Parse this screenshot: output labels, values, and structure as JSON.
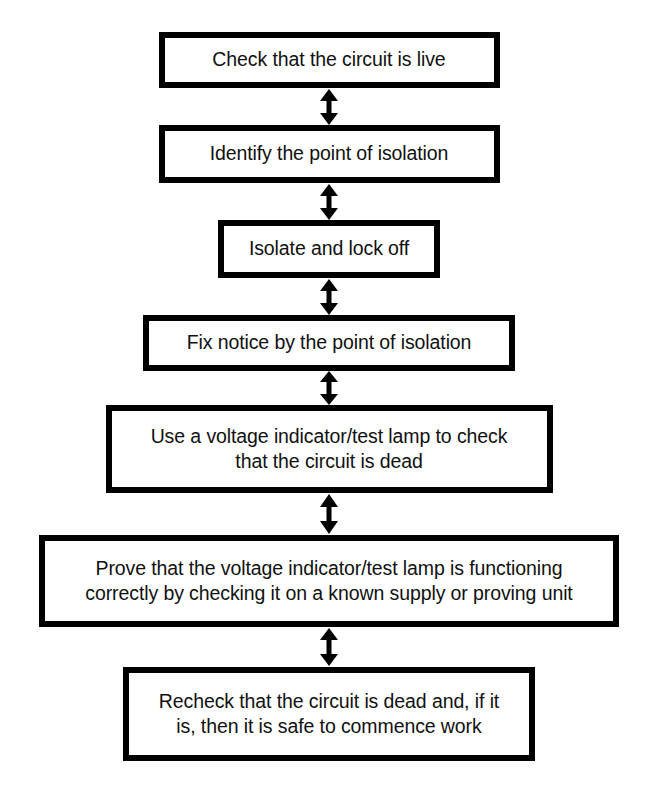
{
  "diagram": {
    "background_color": "#ffffff",
    "border_color": "#000000",
    "text_color": "#111111",
    "connector_icon": "double-headed-vertical-arrow",
    "steps": [
      {
        "id": 1,
        "label": "Check that the circuit is live"
      },
      {
        "id": 2,
        "label": "Identify the point of isolation"
      },
      {
        "id": 3,
        "label": "Isolate and lock off"
      },
      {
        "id": 4,
        "label": "Fix notice by the point of isolation"
      },
      {
        "id": 5,
        "label": "Use a voltage indicator/test lamp to check\nthat the circuit is dead"
      },
      {
        "id": 6,
        "label": "Prove that the voltage indicator/test lamp is functioning\ncorrectly by checking it on a known supply or proving unit"
      },
      {
        "id": 7,
        "label": "Recheck that the circuit is dead and, if it\nis, then it is safe to commence work"
      }
    ],
    "connectors": [
      {
        "id": 1,
        "from_step": 1,
        "to_step": 2,
        "style": "double-headed"
      },
      {
        "id": 2,
        "from_step": 2,
        "to_step": 3,
        "style": "double-headed"
      },
      {
        "id": 3,
        "from_step": 3,
        "to_step": 4,
        "style": "double-headed"
      },
      {
        "id": 4,
        "from_step": 4,
        "to_step": 5,
        "style": "double-headed"
      },
      {
        "id": 5,
        "from_step": 5,
        "to_step": 6,
        "style": "double-headed"
      },
      {
        "id": 6,
        "from_step": 6,
        "to_step": 7,
        "style": "double-headed"
      }
    ]
  }
}
